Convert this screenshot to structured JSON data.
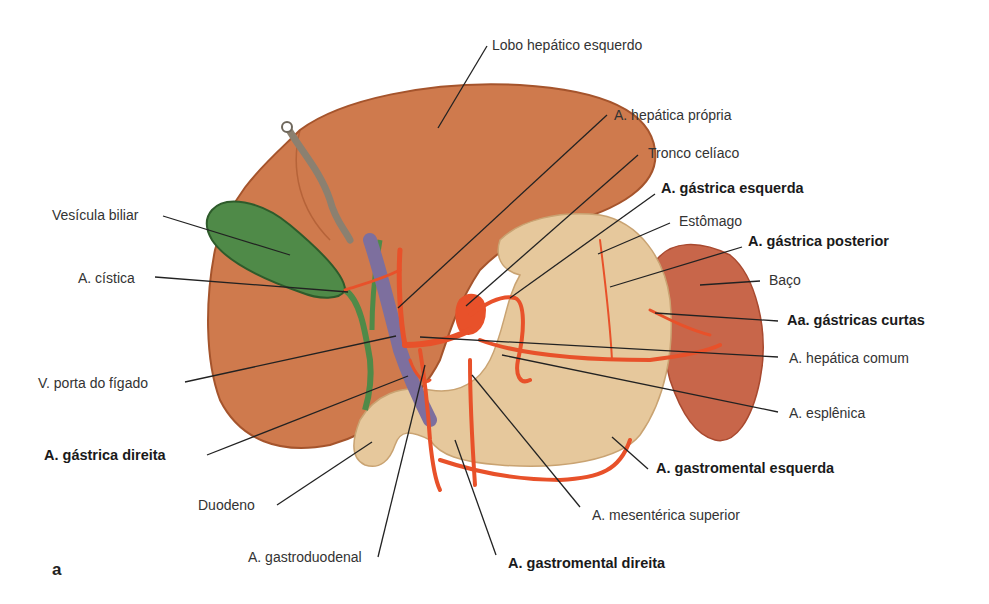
{
  "figure": {
    "panel_letter": "a",
    "colors": {
      "liver": "#cf7a4d",
      "liver_edge": "#a5542c",
      "gallbladder": "#4f8a48",
      "stomach": "#e6c89c",
      "spleen": "#c8664a",
      "artery": "#e8512a",
      "vein": "#7d6f9e",
      "ligament": "#8b8070",
      "leader_line": "#222222"
    },
    "labels": {
      "lobo_hepatico_esquerdo": "Lobo hepático esquerdo",
      "a_hepatica_propria": "A. hepática própria",
      "tronco_celiaco": "Tronco celíaco",
      "a_gastrica_esquerda": "A. gástrica esquerda",
      "estomago": "Estômago",
      "a_gastrica_posterior": "A. gástrica posterior",
      "baco": "Baço",
      "aa_gastricas_curtas": "Aa. gástricas curtas",
      "a_hepatica_comum": "A. hepática comum",
      "a_esplenica": "A. esplênica",
      "a_gastromental_esquerda": "A. gastromental esquerda",
      "a_mesenterica_superior": "A. mesentérica superior",
      "a_gastromental_direita": "A. gastromental direita",
      "a_gastroduodenal": "A. gastroduodenal",
      "duodeno": "Duodeno",
      "a_gastrica_direita": "A. gástrica direita",
      "v_porta_do_figado": "V. porta do fígado",
      "a_cistica": "A. cística",
      "vesicula_biliar": "Vesícula biliar"
    }
  }
}
